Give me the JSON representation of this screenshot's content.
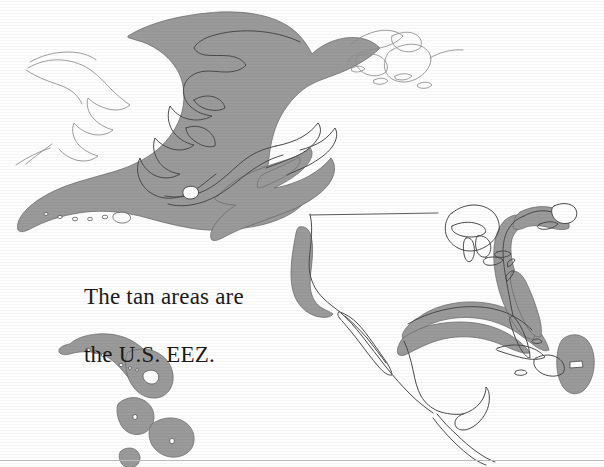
{
  "figure": {
    "kind": "map",
    "background_color": "#fefefe",
    "caption": {
      "line1": "The tan areas are",
      "line2": "the U.S. EEZ."
    },
    "legend_note": "The tan areas are the U.S. EEZ.",
    "colors": {
      "eez_fill": "#9a9a9a",
      "eez_edge": "#6f6f6f",
      "coastline_dark": "#4a4a4a",
      "coastline_light": "#8d8d8d",
      "text": "#1a1a1a",
      "rule": "#b9b9b9",
      "background": "#fefefe"
    },
    "regions": [
      {
        "name": "alaska-bering-aleutian-eez",
        "label": "Alaska / Bering Sea / Aleutian Islands EEZ",
        "shaded": true
      },
      {
        "name": "gulf-of-alaska-eez",
        "label": "Gulf of Alaska EEZ",
        "shaded": true
      },
      {
        "name": "hawaii-eez",
        "label": "Hawaiian Islands EEZ",
        "shaded": true
      },
      {
        "name": "pacific-island-eez-1",
        "label": "Pacific island EEZ",
        "shaded": true
      },
      {
        "name": "pacific-island-eez-2",
        "label": "Pacific island EEZ",
        "shaded": true
      },
      {
        "name": "pacific-island-eez-3",
        "label": "Pacific island EEZ",
        "shaded": true
      },
      {
        "name": "west-coast-eez",
        "label": "U.S. Pacific West Coast EEZ",
        "shaded": true
      },
      {
        "name": "gulf-of-mexico-eez",
        "label": "Gulf of Mexico EEZ",
        "shaded": true
      },
      {
        "name": "atlantic-east-coast-eez",
        "label": "U.S. Atlantic East Coast EEZ",
        "shaded": true
      },
      {
        "name": "puerto-rico-eez",
        "label": "Puerto Rico / U.S. Virgin Islands EEZ",
        "shaded": true
      },
      {
        "name": "continental-united-states",
        "label": "Continental United States",
        "shaded": false
      },
      {
        "name": "canada",
        "label": "Canada",
        "shaded": false
      },
      {
        "name": "canadian-arctic-archipelago",
        "label": "Canadian Arctic Archipelago",
        "shaded": false
      },
      {
        "name": "mexico",
        "label": "Mexico",
        "shaded": false
      },
      {
        "name": "central-america",
        "label": "Central America",
        "shaded": false
      },
      {
        "name": "cuba",
        "label": "Cuba",
        "shaded": false
      },
      {
        "name": "hispaniola",
        "label": "Hispaniola",
        "shaded": false
      },
      {
        "name": "russia-chukotka",
        "label": "Russia (Chukotka)",
        "shaded": false
      },
      {
        "name": "great-lakes",
        "label": "Great Lakes",
        "shaded": false
      }
    ]
  }
}
